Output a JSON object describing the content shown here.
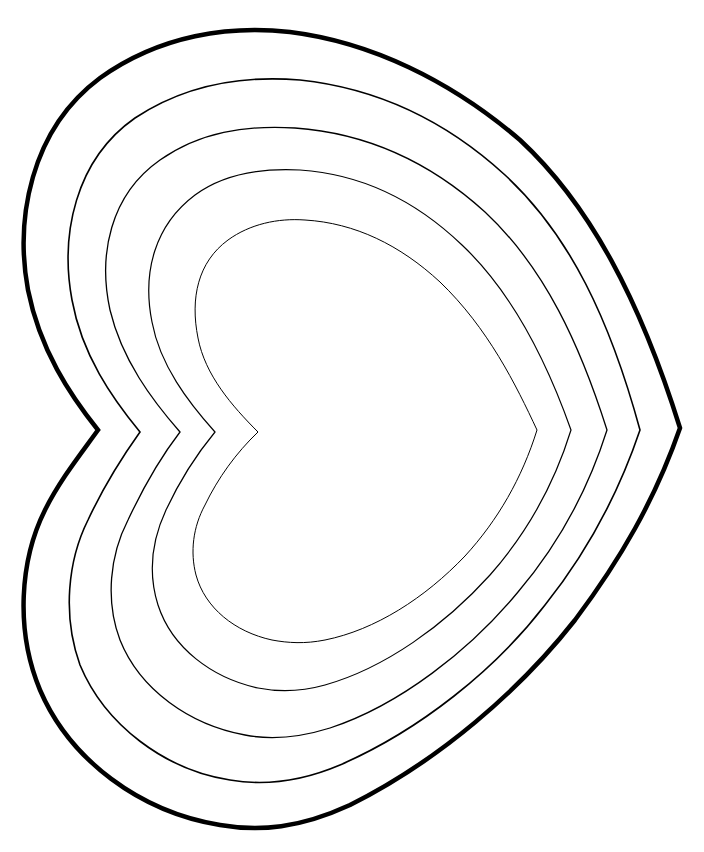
{
  "drawing": {
    "subject": "Nested heart outlines (rotated, point to the right)",
    "background_color": "#ffffff",
    "line_color": "#000000",
    "rings": [
      {
        "name": "outer",
        "stroke_width": 4.5,
        "d": "M98,430 C70,395 40,350 28,290 C15,220 30,130 100,78 C160,35 230,25 290,32 C370,42 450,80 520,140 C590,205 640,300 680,428 C655,500 620,560 575,620 C520,690 440,760 350,805 C300,828 260,832 220,825 C140,812 70,760 40,690 C15,630 20,560 45,510 C60,480 80,455 98,430 Z"
      },
      {
        "name": "ring-2",
        "stroke_width": 1.6,
        "d": "M140,432 C112,398 82,355 72,300 C60,235 75,160 135,118 C185,85 240,75 300,80 C375,88 445,120 505,175 C570,235 610,320 640,430 C618,495 585,555 545,605 C495,670 420,730 340,765 C300,782 265,786 230,780 C165,770 105,725 80,665 C62,615 68,560 88,520 C102,490 120,460 140,432 Z"
      },
      {
        "name": "ring-3",
        "stroke_width": 1.3,
        "d": "M180,432 C152,400 122,360 110,310 C98,255 110,195 160,160 C200,132 245,125 295,128 C365,133 430,162 485,212 C545,268 580,345 607,430 C588,490 558,545 518,592 C470,650 400,705 330,728 C298,738 270,740 245,735 C190,725 140,690 120,640 C105,600 110,555 128,520 C143,488 160,458 180,432 Z"
      },
      {
        "name": "ring-4",
        "stroke_width": 1.2,
        "d": "M215,432 C188,402 160,365 152,322 C142,272 155,225 195,195 C225,173 262,168 300,170 C360,174 415,200 462,245 C515,295 548,365 571,430 C554,485 527,533 490,575 C445,625 385,668 325,685 C300,692 278,692 258,688 C212,678 172,648 158,605 C148,573 152,540 166,510 C180,480 196,455 215,432 Z"
      },
      {
        "name": "ring-5",
        "stroke_width": 1.0,
        "d": "M258,432 C232,406 205,375 198,338 C190,298 198,262 228,240 C250,224 278,218 305,220 C355,223 400,245 440,282 C488,328 516,385 537,430 C522,478 498,520 465,556 C425,598 375,630 325,640 C305,644 288,643 272,640 C235,632 205,608 196,575 C190,552 193,527 205,505 C218,478 236,453 258,432 Z"
      }
    ]
  }
}
